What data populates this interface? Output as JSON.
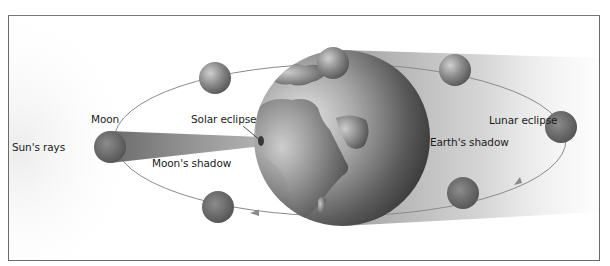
{
  "diagram": {
    "labels": {
      "sun_rays": "Sun's rays",
      "moon": "Moon",
      "solar_eclipse": "Solar eclipse",
      "moons_shadow": "Moon's shadow",
      "lunar_eclipse": "Lunar eclipse",
      "earths_shadow": "Earth's shadow"
    },
    "bodies": {
      "earth": {
        "cx": 342,
        "cy": 138,
        "r": 88
      },
      "moons": [
        {
          "id": "moon-left",
          "cx": 110,
          "cy": 147,
          "r": 16
        },
        {
          "id": "moon-top-left",
          "cx": 215,
          "cy": 78,
          "r": 16
        },
        {
          "id": "moon-top",
          "cx": 333,
          "cy": 63,
          "r": 16
        },
        {
          "id": "moon-top-right",
          "cx": 455,
          "cy": 70,
          "r": 16
        },
        {
          "id": "moon-lunar-eclipse",
          "cx": 561,
          "cy": 127,
          "r": 16
        },
        {
          "id": "moon-bottom-right",
          "cx": 463,
          "cy": 193,
          "r": 16
        },
        {
          "id": "moon-bottom",
          "cx": 218,
          "cy": 207,
          "r": 16
        }
      ]
    },
    "colors": {
      "frame": "#6a6a6a",
      "orbit": "#8a8a8a",
      "earth_light": "#d8d8d8",
      "earth_dark": "#2e2e2e",
      "shadow": "#bdbdbd",
      "text": "#1c1c1c"
    }
  }
}
